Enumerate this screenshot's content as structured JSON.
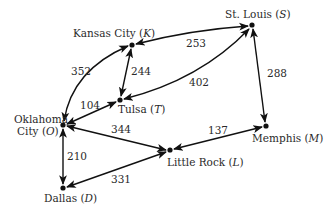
{
  "diagram": {
    "type": "weighted-directed-graph",
    "nodes": [
      {
        "id": "K",
        "name": "Kansas City",
        "letter": "K",
        "x": 132,
        "y": 45
      },
      {
        "id": "S",
        "name": "St. Louis",
        "letter": "S",
        "x": 252,
        "y": 25
      },
      {
        "id": "T",
        "name": "Tulsa",
        "letter": "T",
        "x": 120,
        "y": 100
      },
      {
        "id": "O",
        "name": "Oklahoma City",
        "letter": "O",
        "x": 63,
        "y": 125
      },
      {
        "id": "L",
        "name": "Little Rock",
        "letter": "L",
        "x": 170,
        "y": 150
      },
      {
        "id": "M",
        "name": "Memphis",
        "letter": "M",
        "x": 266,
        "y": 126
      },
      {
        "id": "D",
        "name": "Dallas",
        "letter": "D",
        "x": 63,
        "y": 188
      }
    ],
    "labels": {
      "K": {
        "text": "Kansas City (",
        "letter": "K",
        "close": ")"
      },
      "S": {
        "text": "St. Louis (",
        "letter": "S",
        "close": ")"
      },
      "T": {
        "text": "Tulsa (",
        "letter": "T",
        "close": ")"
      },
      "O_line1": "Oklahoma",
      "O_line2": {
        "text": "City (",
        "letter": "O",
        "close": ")"
      },
      "L": {
        "text": "Little Rock (",
        "letter": "L",
        "close": ")"
      },
      "M": {
        "text": "Memphis (",
        "letter": "M",
        "close": ")"
      },
      "D": {
        "text": "Dallas (",
        "letter": "D",
        "close": ")"
      }
    },
    "edges": [
      {
        "from": "K",
        "to": "S",
        "weight": "253",
        "bidirectional": true
      },
      {
        "from": "K",
        "to": "T",
        "weight": "244",
        "bidirectional": true
      },
      {
        "from": "K",
        "to": "O",
        "weight": "352",
        "bidirectional": true
      },
      {
        "from": "T",
        "to": "S",
        "weight": "402",
        "bidirectional": true
      },
      {
        "from": "T",
        "to": "O",
        "weight": "104",
        "bidirectional": true
      },
      {
        "from": "S",
        "to": "M",
        "weight": "288",
        "bidirectional": true
      },
      {
        "from": "O",
        "to": "L",
        "weight": "344",
        "bidirectional": true
      },
      {
        "from": "O",
        "to": "D",
        "weight": "210",
        "bidirectional": true
      },
      {
        "from": "L",
        "to": "M",
        "weight": "137",
        "bidirectional": true
      },
      {
        "from": "D",
        "to": "L",
        "weight": "331",
        "bidirectional": true
      }
    ],
    "weights": {
      "KS": "253",
      "KT": "244",
      "KO": "352",
      "TS": "402",
      "TO": "104",
      "SM": "288",
      "OL": "344",
      "OD": "210",
      "LM": "137",
      "DL": "331"
    }
  }
}
